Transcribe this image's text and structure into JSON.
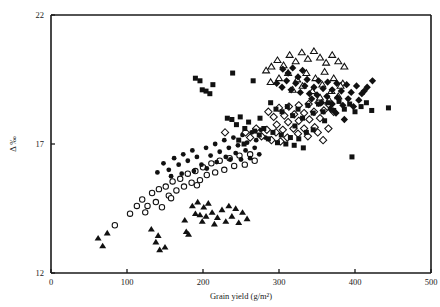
{
  "chart_data": {
    "type": "scatter",
    "title": "",
    "xlabel": "Grain yield (g/m²)",
    "ylabel": "Δ ‰",
    "xlim": [
      0,
      500
    ],
    "ylim": [
      12,
      22
    ],
    "xticks": [
      0,
      100,
      200,
      300,
      400,
      500
    ],
    "xtick_labels": [
      "0",
      "100",
      "200",
      "300",
      "400",
      "500"
    ],
    "yticks": [
      12,
      17,
      22
    ],
    "ytick_labels": [
      "12",
      "17",
      "22"
    ],
    "grid": false,
    "legend": "none",
    "frame": "left-bottom-top-right-partial",
    "series": [
      {
        "name": "filled-triangle",
        "marker": "triangle-filled",
        "size": 5.6,
        "points": [
          [
            62,
            13.35
          ],
          [
            68,
            13.05
          ],
          [
            74,
            13.55
          ],
          [
            132,
            13.7
          ],
          [
            138,
            13.2
          ],
          [
            141,
            13.45
          ],
          [
            143,
            12.9
          ],
          [
            150,
            13.0
          ],
          [
            176,
            14.05
          ],
          [
            178,
            13.6
          ],
          [
            186,
            14.6
          ],
          [
            190,
            14.3
          ],
          [
            193,
            14.75
          ],
          [
            196,
            14.25
          ],
          [
            199,
            14.0
          ],
          [
            201,
            14.55
          ],
          [
            204,
            14.2
          ],
          [
            207,
            14.7
          ],
          [
            212,
            14.35
          ],
          [
            215,
            13.9
          ],
          [
            219,
            14.15
          ],
          [
            225,
            14.45
          ],
          [
            230,
            14.0
          ],
          [
            234,
            14.6
          ],
          [
            238,
            14.2
          ],
          [
            243,
            14.5
          ],
          [
            247,
            13.95
          ],
          [
            252,
            14.35
          ],
          [
            258,
            14.1
          ],
          [
            181,
            13.5
          ]
        ]
      },
      {
        "name": "open-circle",
        "marker": "circle-open",
        "size": 2.7,
        "points": [
          [
            84,
            13.85
          ],
          [
            104,
            14.3
          ],
          [
            113,
            14.6
          ],
          [
            120,
            14.85
          ],
          [
            127,
            14.6
          ],
          [
            133,
            15.1
          ],
          [
            138,
            14.75
          ],
          [
            142,
            15.25
          ],
          [
            146,
            14.55
          ],
          [
            151,
            15.35
          ],
          [
            155,
            15.0
          ],
          [
            160,
            15.55
          ],
          [
            165,
            15.2
          ],
          [
            170,
            15.65
          ],
          [
            175,
            15.35
          ],
          [
            180,
            15.85
          ],
          [
            185,
            15.5
          ],
          [
            190,
            15.95
          ],
          [
            196,
            15.6
          ],
          [
            200,
            16.1
          ],
          [
            205,
            15.8
          ],
          [
            211,
            16.25
          ],
          [
            216,
            15.9
          ],
          [
            222,
            16.35
          ],
          [
            228,
            16.0
          ],
          [
            235,
            16.45
          ],
          [
            241,
            16.15
          ],
          [
            248,
            16.55
          ],
          [
            255,
            16.2
          ],
          [
            262,
            16.6
          ],
          [
            268,
            16.35
          ],
          [
            124,
            14.35
          ],
          [
            158,
            14.9
          ],
          [
            192,
            15.4
          ]
        ]
      },
      {
        "name": "filled-circle",
        "marker": "circle-filled",
        "size": 2.4,
        "points": [
          [
            140,
            15.9
          ],
          [
            148,
            16.25
          ],
          [
            155,
            16.0
          ],
          [
            162,
            16.45
          ],
          [
            168,
            16.2
          ],
          [
            174,
            16.6
          ],
          [
            180,
            16.35
          ],
          [
            186,
            16.75
          ],
          [
            192,
            16.5
          ],
          [
            198,
            16.2
          ],
          [
            204,
            16.85
          ],
          [
            210,
            16.55
          ],
          [
            216,
            17.0
          ],
          [
            222,
            16.7
          ],
          [
            228,
            17.15
          ],
          [
            234,
            16.85
          ],
          [
            240,
            17.25
          ],
          [
            246,
            16.95
          ],
          [
            252,
            17.35
          ],
          [
            258,
            17.05
          ],
          [
            264,
            17.45
          ],
          [
            270,
            17.15
          ],
          [
            276,
            17.55
          ],
          [
            282,
            17.25
          ],
          [
            230,
            16.5
          ],
          [
            236,
            16.4
          ],
          [
            243,
            16.65
          ],
          [
            250,
            16.4
          ],
          [
            256,
            16.75
          ],
          [
            262,
            16.45
          ],
          [
            268,
            16.85
          ],
          [
            274,
            16.6
          ],
          [
            188,
            15.95
          ],
          [
            205,
            16.05
          ],
          [
            218,
            16.3
          ],
          [
            158,
            15.75
          ],
          [
            172,
            15.85
          ]
        ]
      },
      {
        "name": "filled-square",
        "marker": "square-filled",
        "size": 5.0,
        "points": [
          [
            190,
            19.55
          ],
          [
            196,
            19.45
          ],
          [
            199,
            19.1
          ],
          [
            204,
            19.05
          ],
          [
            209,
            18.95
          ],
          [
            213,
            19.3
          ],
          [
            239,
            19.75
          ],
          [
            266,
            19.45
          ],
          [
            232,
            18.0
          ],
          [
            238,
            17.95
          ],
          [
            244,
            17.75
          ],
          [
            249,
            18.05
          ],
          [
            255,
            17.6
          ],
          [
            260,
            17.85
          ],
          [
            268,
            17.5
          ],
          [
            274,
            17.35
          ],
          [
            280,
            17.6
          ],
          [
            286,
            17.2
          ],
          [
            292,
            17.45
          ],
          [
            298,
            17.05
          ],
          [
            303,
            17.35
          ],
          [
            309,
            17.0
          ],
          [
            315,
            17.25
          ],
          [
            320,
            16.95
          ],
          [
            326,
            17.2
          ],
          [
            332,
            16.85
          ],
          [
            296,
            18.35
          ],
          [
            304,
            18.25
          ],
          [
            311,
            18.45
          ],
          [
            318,
            18.1
          ],
          [
            325,
            18.35
          ],
          [
            331,
            18.0
          ],
          [
            338,
            18.5
          ],
          [
            345,
            18.2
          ],
          [
            352,
            18.55
          ],
          [
            358,
            18.25
          ],
          [
            365,
            18.6
          ],
          [
            372,
            18.3
          ],
          [
            379,
            18.65
          ],
          [
            386,
            18.35
          ],
          [
            393,
            18.55
          ],
          [
            400,
            18.25
          ],
          [
            408,
            18.45
          ],
          [
            415,
            18.6
          ],
          [
            422,
            18.3
          ],
          [
            444,
            18.4
          ],
          [
            396,
            16.5
          ],
          [
            345,
            17.55
          ],
          [
            360,
            17.9
          ],
          [
            336,
            17.45
          ],
          [
            321,
            17.7
          ],
          [
            275,
            18.0
          ],
          [
            289,
            18.6
          ],
          [
            247,
            17.15
          ],
          [
            254,
            17.0
          ]
        ]
      },
      {
        "name": "open-diamond",
        "marker": "diamond-open",
        "size": 5.2,
        "points": [
          [
            229,
            17.45
          ],
          [
            256,
            17.45
          ],
          [
            262,
            17.25
          ],
          [
            270,
            17.6
          ],
          [
            277,
            17.3
          ],
          [
            284,
            17.55
          ],
          [
            290,
            17.15
          ],
          [
            296,
            17.45
          ],
          [
            302,
            17.1
          ],
          [
            286,
            18.25
          ],
          [
            293,
            18.05
          ],
          [
            300,
            18.4
          ],
          [
            307,
            18.1
          ],
          [
            313,
            18.45
          ],
          [
            320,
            18.15
          ],
          [
            326,
            18.5
          ],
          [
            333,
            18.2
          ],
          [
            339,
            18.55
          ],
          [
            346,
            18.25
          ],
          [
            352,
            18.6
          ],
          [
            359,
            18.3
          ],
          [
            365,
            18.55
          ],
          [
            372,
            18.25
          ],
          [
            297,
            17.75
          ],
          [
            305,
            17.55
          ],
          [
            312,
            17.85
          ],
          [
            319,
            17.6
          ],
          [
            326,
            17.9
          ],
          [
            333,
            17.6
          ],
          [
            340,
            17.95
          ],
          [
            347,
            17.65
          ],
          [
            354,
            18.0
          ],
          [
            311,
            17.25
          ],
          [
            325,
            17.4
          ],
          [
            338,
            17.3
          ],
          [
            351,
            17.45
          ],
          [
            358,
            17.15
          ],
          [
            365,
            17.6
          ]
        ]
      },
      {
        "name": "filled-diamond",
        "marker": "diamond-filled",
        "size": 5.2,
        "points": [
          [
            305,
            19.9
          ],
          [
            312,
            19.75
          ],
          [
            318,
            19.95
          ],
          [
            325,
            19.6
          ],
          [
            331,
            19.85
          ],
          [
            337,
            19.5
          ],
          [
            297,
            19.35
          ],
          [
            304,
            19.2
          ],
          [
            310,
            19.45
          ],
          [
            316,
            19.1
          ],
          [
            322,
            19.35
          ],
          [
            328,
            19.0
          ],
          [
            334,
            19.25
          ],
          [
            340,
            18.95
          ],
          [
            346,
            19.2
          ],
          [
            352,
            19.45
          ],
          [
            358,
            19.15
          ],
          [
            364,
            19.4
          ],
          [
            370,
            19.1
          ],
          [
            376,
            19.35
          ],
          [
            382,
            19.05
          ],
          [
            389,
            19.3
          ],
          [
            395,
            19.0
          ],
          [
            402,
            19.25
          ],
          [
            409,
            18.95
          ],
          [
            416,
            19.2
          ],
          [
            423,
            19.45
          ],
          [
            343,
            18.75
          ],
          [
            350,
            18.9
          ],
          [
            356,
            18.6
          ],
          [
            363,
            18.85
          ],
          [
            370,
            18.55
          ],
          [
            377,
            18.8
          ],
          [
            384,
            18.5
          ],
          [
            391,
            18.75
          ],
          [
            398,
            18.45
          ],
          [
            405,
            18.7
          ],
          [
            412,
            19.05
          ],
          [
            375,
            18.2
          ],
          [
            386,
            17.95
          ],
          [
            368,
            18.35
          ]
        ]
      },
      {
        "name": "open-triangle",
        "marker": "triangle-open",
        "size": 5.6,
        "points": [
          [
            290,
            20.0
          ],
          [
            298,
            20.25
          ],
          [
            306,
            20.05
          ],
          [
            314,
            20.45
          ],
          [
            322,
            20.2
          ],
          [
            330,
            20.55
          ],
          [
            338,
            20.3
          ],
          [
            346,
            20.6
          ],
          [
            354,
            20.35
          ],
          [
            362,
            20.15
          ],
          [
            370,
            20.45
          ],
          [
            378,
            20.2
          ],
          [
            386,
            20.0
          ],
          [
            300,
            19.55
          ],
          [
            312,
            19.75
          ],
          [
            324,
            19.5
          ],
          [
            336,
            19.75
          ],
          [
            348,
            19.55
          ],
          [
            360,
            19.8
          ],
          [
            372,
            19.55
          ],
          [
            384,
            19.35
          ],
          [
            318,
            19.1
          ],
          [
            331,
            19.25
          ],
          [
            344,
            19.05
          ],
          [
            357,
            19.3
          ],
          [
            369,
            19.05
          ],
          [
            381,
            19.25
          ],
          [
            354,
            18.8
          ],
          [
            366,
            18.7
          ],
          [
            378,
            18.85
          ],
          [
            283,
            19.85
          ],
          [
            289,
            19.4
          ]
        ]
      }
    ]
  },
  "axes": {
    "x_title": "Grain yield (g/m²)",
    "y_title": "Δ ‰",
    "x_tick_labels": [
      "0",
      "100",
      "200",
      "300",
      "400",
      "500"
    ],
    "y_tick_labels": [
      "12",
      "17",
      "22"
    ]
  },
  "colors": {
    "marker_fill": "#111111",
    "marker_stroke": "#111111",
    "axis": "#1a1a1a",
    "background": "#ffffff"
  }
}
